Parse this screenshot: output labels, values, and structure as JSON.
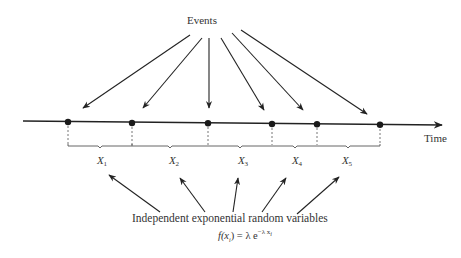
{
  "diagram": {
    "title_label": "Events",
    "axis_label": "Time",
    "caption": "Independent exponential random variables",
    "formula": {
      "lhs": "f(x",
      "lhs_sub": "i",
      "lhs_close": ")",
      "equals": " = λ e",
      "exp": "−λ x",
      "exp_sub": "i"
    },
    "variables": [
      {
        "name": "X",
        "index": "1"
      },
      {
        "name": "X",
        "index": "2"
      },
      {
        "name": "X",
        "index": "3"
      },
      {
        "name": "X",
        "index": "4"
      },
      {
        "name": "X",
        "index": "5"
      }
    ],
    "event_count": 6
  }
}
